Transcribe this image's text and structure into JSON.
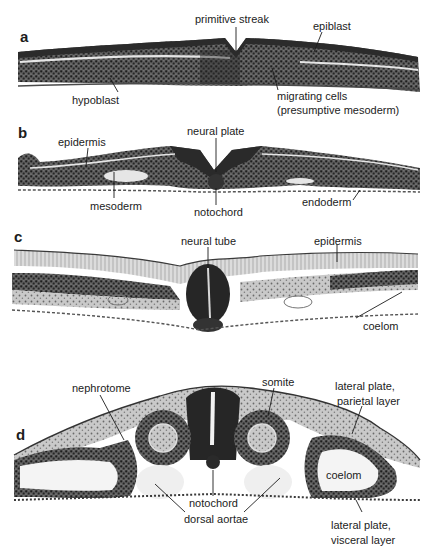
{
  "figure": {
    "panels": [
      {
        "id": "a",
        "labels": {
          "primitive_streak": "primitive streak",
          "epiblast": "epiblast",
          "hypoblast": "hypoblast",
          "migrating_cells_1": "migrating cells",
          "migrating_cells_2": "(presumptive mesoderm)"
        }
      },
      {
        "id": "b",
        "labels": {
          "epidermis": "epidermis",
          "neural_plate": "neural plate",
          "mesoderm": "mesoderm",
          "notochord": "notochord",
          "endoderm": "endoderm"
        }
      },
      {
        "id": "c",
        "labels": {
          "neural_tube": "neural tube",
          "epidermis": "epidermis",
          "coelom": "coelom"
        }
      },
      {
        "id": "d",
        "labels": {
          "nephrotome": "nephrotome",
          "somite": "somite",
          "lateral_plate_parietal_1": "lateral plate,",
          "lateral_plate_parietal_2": "parietal layer",
          "coelom": "coelom",
          "notochord": "notochord",
          "dorsal_aortae": "dorsal aortae",
          "lateral_plate_visceral_1": "lateral plate,",
          "lateral_plate_visceral_2": "visceral layer"
        }
      }
    ],
    "colors": {
      "tissue_dark": "#2a2a2a",
      "tissue_mid": "#6b6b6b",
      "tissue_light": "#cfcfcf",
      "background": "#ffffff"
    }
  }
}
